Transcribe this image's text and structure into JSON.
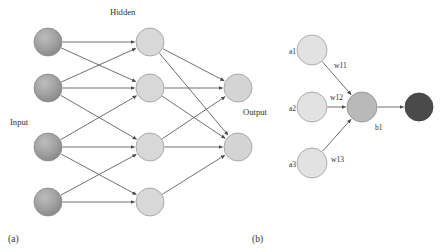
{
  "figure": {
    "background_color": "#ffffff",
    "edge_color": "#565656"
  },
  "panels": [
    {
      "id": "a",
      "label": "(a)",
      "label_pos": {
        "x": 8,
        "y": 240
      },
      "description": "Feed-forward network with input, hidden and output layers",
      "layer_labels": [
        {
          "name": "input-layer-label",
          "text": "Input",
          "x": 10,
          "y": 123
        },
        {
          "name": "hidden-layer-label",
          "text": "Hidden",
          "x": 110,
          "y": 13
        },
        {
          "name": "output-layer-label",
          "text": "Output",
          "x": 243,
          "y": 113
        }
      ],
      "nodes": [
        {
          "id": "i1",
          "layer": "input",
          "cx": 48,
          "cy": 42,
          "r": 14,
          "fill": "#9a9a9a",
          "stroke": "#8a8a8a",
          "shaded": true
        },
        {
          "id": "i2",
          "layer": "input",
          "cx": 48,
          "cy": 88,
          "r": 14,
          "fill": "#9a9a9a",
          "stroke": "#8a8a8a",
          "shaded": true
        },
        {
          "id": "i3",
          "layer": "input",
          "cx": 48,
          "cy": 147,
          "r": 14,
          "fill": "#9a9a9a",
          "stroke": "#8a8a8a",
          "shaded": true
        },
        {
          "id": "i4",
          "layer": "input",
          "cx": 48,
          "cy": 202,
          "r": 14,
          "fill": "#9a9a9a",
          "stroke": "#8a8a8a",
          "shaded": true
        },
        {
          "id": "h1",
          "layer": "hidden",
          "cx": 150,
          "cy": 42,
          "r": 14,
          "fill": "#d8d8d8",
          "stroke": "#9c9c9c",
          "shaded": false
        },
        {
          "id": "h2",
          "layer": "hidden",
          "cx": 150,
          "cy": 88,
          "r": 14,
          "fill": "#d8d8d8",
          "stroke": "#9c9c9c",
          "shaded": false
        },
        {
          "id": "h3",
          "layer": "hidden",
          "cx": 150,
          "cy": 147,
          "r": 14,
          "fill": "#d8d8d8",
          "stroke": "#9c9c9c",
          "shaded": false
        },
        {
          "id": "h4",
          "layer": "hidden",
          "cx": 150,
          "cy": 202,
          "r": 14,
          "fill": "#d8d8d8",
          "stroke": "#9c9c9c",
          "shaded": false
        },
        {
          "id": "o1",
          "layer": "output",
          "cx": 238,
          "cy": 88,
          "r": 14,
          "fill": "#d4d4d4",
          "stroke": "#9c9c9c",
          "shaded": false
        },
        {
          "id": "o2",
          "layer": "output",
          "cx": 238,
          "cy": 147,
          "r": 14,
          "fill": "#d4d4d4",
          "stroke": "#9c9c9c",
          "shaded": false
        }
      ],
      "edges": [
        {
          "from": "i1",
          "to": "h1"
        },
        {
          "from": "i1",
          "to": "h2"
        },
        {
          "from": "i2",
          "to": "h1"
        },
        {
          "from": "i2",
          "to": "h2"
        },
        {
          "from": "i2",
          "to": "h3"
        },
        {
          "from": "i3",
          "to": "h2"
        },
        {
          "from": "i3",
          "to": "h3"
        },
        {
          "from": "i3",
          "to": "h4"
        },
        {
          "from": "i4",
          "to": "h3"
        },
        {
          "from": "i4",
          "to": "h4"
        },
        {
          "from": "h1",
          "to": "o1"
        },
        {
          "from": "h1",
          "to": "o2"
        },
        {
          "from": "h2",
          "to": "o1"
        },
        {
          "from": "h2",
          "to": "o2"
        },
        {
          "from": "h3",
          "to": "o1"
        },
        {
          "from": "h3",
          "to": "o2"
        },
        {
          "from": "h4",
          "to": "o2"
        }
      ]
    },
    {
      "id": "b",
      "label": "(b)",
      "label_pos": {
        "x": 252,
        "y": 240
      },
      "description": "Single neuron with three weighted inputs",
      "nodes": [
        {
          "id": "a1",
          "cx": 312,
          "cy": 50,
          "r": 15,
          "fill": "#e2e2e2",
          "stroke": "#9c9c9c",
          "shaded": false
        },
        {
          "id": "a2",
          "cx": 312,
          "cy": 107,
          "r": 15,
          "fill": "#e2e2e2",
          "stroke": "#9c9c9c",
          "shaded": false
        },
        {
          "id": "a3",
          "cx": 312,
          "cy": 163,
          "r": 15,
          "fill": "#e2e2e2",
          "stroke": "#9c9c9c",
          "shaded": false
        },
        {
          "id": "b1",
          "cx": 362,
          "cy": 107,
          "r": 15,
          "fill": "#b9b9b9",
          "stroke": "#8a8a8a",
          "shaded": false
        },
        {
          "id": "out",
          "cx": 419,
          "cy": 107,
          "r": 14,
          "fill": "#4a4a4a",
          "stroke": "#3c3c3c",
          "shaded": false
        }
      ],
      "node_labels": [
        {
          "name": "node-label-a1",
          "text": "a1",
          "x": 289,
          "y": 52
        },
        {
          "name": "node-label-a2",
          "text": "a2",
          "x": 289,
          "y": 109
        },
        {
          "name": "node-label-a3",
          "text": "a3",
          "x": 289,
          "y": 165
        },
        {
          "name": "node-label-b1",
          "text": "b1",
          "x": 375,
          "y": 128
        }
      ],
      "weight_labels": [
        {
          "name": "weight-label-w11",
          "text": "w11",
          "x": 334,
          "y": 66
        },
        {
          "name": "weight-label-w12",
          "text": "w12",
          "x": 330,
          "y": 98
        },
        {
          "name": "weight-label-w13",
          "text": "w13",
          "x": 331,
          "y": 160
        }
      ],
      "edges": [
        {
          "from": "a1",
          "to": "b1",
          "weight": "w11"
        },
        {
          "from": "a2",
          "to": "b1",
          "weight": "w12"
        },
        {
          "from": "a3",
          "to": "b1",
          "weight": "w13"
        },
        {
          "from": "b1",
          "to": "out",
          "weight": ""
        }
      ]
    }
  ]
}
